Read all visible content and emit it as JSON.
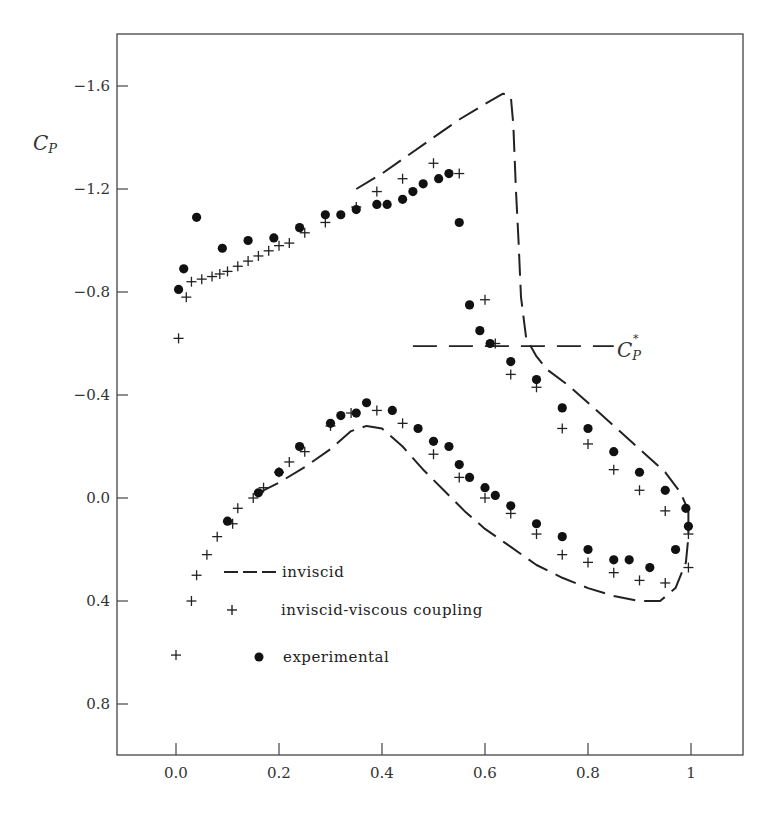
{
  "chart_data": {
    "type": "scatter",
    "title": "",
    "xlabel": "",
    "ylabel": "C_P",
    "xlim": [
      -0.11,
      1.1
    ],
    "ylim": [
      1.0,
      -1.8
    ],
    "y_inverted": true,
    "grid": false,
    "legend_position": "lower-left inside plot",
    "x_ticks": [
      {
        "value": 0.0,
        "label": "0.0"
      },
      {
        "value": 0.2,
        "label": "0.2"
      },
      {
        "value": 0.4,
        "label": "0.4"
      },
      {
        "value": 0.6,
        "label": "0.6"
      },
      {
        "value": 0.8,
        "label": "0.8"
      },
      {
        "value": 1.0,
        "label": "1"
      }
    ],
    "y_ticks": [
      {
        "value": -1.6,
        "label": "−1.6"
      },
      {
        "value": -1.2,
        "label": "−1.2"
      },
      {
        "value": -0.8,
        "label": "−0.8"
      },
      {
        "value": -0.4,
        "label": "−0.4"
      },
      {
        "value": 0.0,
        "label": "0.0"
      },
      {
        "value": 0.4,
        "label": "0.4"
      },
      {
        "value": 0.8,
        "label": "0.8"
      }
    ],
    "annotations": [
      {
        "text": "C_P*",
        "x": 0.86,
        "y": -0.59,
        "note": "critical pressure coefficient, horizontal dashed line from x=0.46 to x=0.86"
      }
    ],
    "critical_cp": {
      "value": -0.59,
      "x_start": 0.46,
      "x_end": 0.85
    },
    "series": [
      {
        "name": "inviscid",
        "style": "dashed-line",
        "upper": [
          [
            0.35,
            -1.2
          ],
          [
            0.4,
            -1.26
          ],
          [
            0.45,
            -1.33
          ],
          [
            0.5,
            -1.4
          ],
          [
            0.55,
            -1.47
          ],
          [
            0.6,
            -1.53
          ],
          [
            0.635,
            -1.57
          ],
          [
            0.65,
            -1.56
          ],
          [
            0.655,
            -1.45
          ],
          [
            0.66,
            -1.2
          ],
          [
            0.665,
            -1.0
          ],
          [
            0.67,
            -0.78
          ],
          [
            0.68,
            -0.62
          ],
          [
            0.7,
            -0.55
          ],
          [
            0.72,
            -0.5
          ],
          [
            0.76,
            -0.44
          ],
          [
            0.8,
            -0.37
          ],
          [
            0.85,
            -0.28
          ],
          [
            0.9,
            -0.19
          ],
          [
            0.95,
            -0.1
          ],
          [
            0.98,
            -0.02
          ],
          [
            0.995,
            0.05
          ]
        ],
        "lower": [
          [
            0.16,
            -0.02
          ],
          [
            0.2,
            -0.06
          ],
          [
            0.25,
            -0.12
          ],
          [
            0.3,
            -0.19
          ],
          [
            0.34,
            -0.26
          ],
          [
            0.37,
            -0.28
          ],
          [
            0.4,
            -0.27
          ],
          [
            0.44,
            -0.2
          ],
          [
            0.48,
            -0.11
          ],
          [
            0.52,
            -0.03
          ],
          [
            0.56,
            0.05
          ],
          [
            0.6,
            0.12
          ],
          [
            0.65,
            0.19
          ],
          [
            0.7,
            0.26
          ],
          [
            0.75,
            0.31
          ],
          [
            0.8,
            0.35
          ],
          [
            0.85,
            0.38
          ],
          [
            0.9,
            0.4
          ],
          [
            0.94,
            0.4
          ],
          [
            0.97,
            0.35
          ],
          [
            0.99,
            0.25
          ],
          [
            0.995,
            0.15
          ],
          [
            0.995,
            0.05
          ]
        ]
      },
      {
        "name": "inviscid-viscous coupling",
        "marker": "+",
        "points": [
          [
            0.005,
            -0.62
          ],
          [
            0.02,
            -0.78
          ],
          [
            0.03,
            -0.84
          ],
          [
            0.05,
            -0.85
          ],
          [
            0.07,
            -0.86
          ],
          [
            0.085,
            -0.87
          ],
          [
            0.1,
            -0.88
          ],
          [
            0.12,
            -0.9
          ],
          [
            0.14,
            -0.92
          ],
          [
            0.16,
            -0.94
          ],
          [
            0.18,
            -0.96
          ],
          [
            0.2,
            -0.98
          ],
          [
            0.22,
            -0.99
          ],
          [
            0.25,
            -1.03
          ],
          [
            0.29,
            -1.07
          ],
          [
            0.35,
            -1.13
          ],
          [
            0.39,
            -1.19
          ],
          [
            0.44,
            -1.24
          ],
          [
            0.5,
            -1.3
          ],
          [
            0.55,
            -1.26
          ],
          [
            0.6,
            -0.77
          ],
          [
            0.62,
            -0.6
          ],
          [
            0.65,
            -0.48
          ],
          [
            0.7,
            -0.43
          ],
          [
            0.75,
            -0.27
          ],
          [
            0.8,
            -0.21
          ],
          [
            0.85,
            -0.11
          ],
          [
            0.9,
            -0.03
          ],
          [
            0.95,
            0.05
          ],
          [
            0.995,
            0.14
          ],
          [
            0.0,
            0.61
          ],
          [
            0.03,
            0.4
          ],
          [
            0.04,
            0.3
          ],
          [
            0.06,
            0.22
          ],
          [
            0.08,
            0.15
          ],
          [
            0.11,
            0.1
          ],
          [
            0.12,
            0.04
          ],
          [
            0.15,
            0.0
          ],
          [
            0.17,
            -0.04
          ],
          [
            0.2,
            -0.1
          ],
          [
            0.22,
            -0.14
          ],
          [
            0.25,
            -0.18
          ],
          [
            0.3,
            -0.28
          ],
          [
            0.34,
            -0.33
          ],
          [
            0.39,
            -0.34
          ],
          [
            0.44,
            -0.29
          ],
          [
            0.5,
            -0.17
          ],
          [
            0.55,
            -0.08
          ],
          [
            0.6,
            -0.0
          ],
          [
            0.65,
            0.06
          ],
          [
            0.7,
            0.14
          ],
          [
            0.75,
            0.22
          ],
          [
            0.8,
            0.25
          ],
          [
            0.85,
            0.29
          ],
          [
            0.9,
            0.32
          ],
          [
            0.95,
            0.33
          ],
          [
            0.995,
            0.27
          ]
        ]
      },
      {
        "name": "experimental",
        "marker": "filled-circle",
        "points": [
          [
            0.005,
            -0.81
          ],
          [
            0.015,
            -0.89
          ],
          [
            0.04,
            -1.09
          ],
          [
            0.09,
            -0.97
          ],
          [
            0.14,
            -1.0
          ],
          [
            0.19,
            -1.01
          ],
          [
            0.24,
            -1.05
          ],
          [
            0.29,
            -1.1
          ],
          [
            0.32,
            -1.1
          ],
          [
            0.35,
            -1.12
          ],
          [
            0.39,
            -1.14
          ],
          [
            0.41,
            -1.14
          ],
          [
            0.44,
            -1.16
          ],
          [
            0.46,
            -1.19
          ],
          [
            0.48,
            -1.22
          ],
          [
            0.51,
            -1.24
          ],
          [
            0.53,
            -1.26
          ],
          [
            0.55,
            -1.07
          ],
          [
            0.57,
            -0.75
          ],
          [
            0.59,
            -0.65
          ],
          [
            0.61,
            -0.6
          ],
          [
            0.65,
            -0.53
          ],
          [
            0.7,
            -0.46
          ],
          [
            0.75,
            -0.35
          ],
          [
            0.8,
            -0.27
          ],
          [
            0.85,
            -0.18
          ],
          [
            0.9,
            -0.1
          ],
          [
            0.95,
            -0.03
          ],
          [
            0.99,
            0.04
          ],
          [
            0.995,
            0.11
          ],
          [
            0.1,
            0.09
          ],
          [
            0.16,
            -0.02
          ],
          [
            0.2,
            -0.1
          ],
          [
            0.24,
            -0.2
          ],
          [
            0.3,
            -0.29
          ],
          [
            0.32,
            -0.32
          ],
          [
            0.35,
            -0.33
          ],
          [
            0.37,
            -0.37
          ],
          [
            0.42,
            -0.34
          ],
          [
            0.47,
            -0.27
          ],
          [
            0.5,
            -0.22
          ],
          [
            0.53,
            -0.2
          ],
          [
            0.55,
            -0.13
          ],
          [
            0.57,
            -0.08
          ],
          [
            0.6,
            -0.04
          ],
          [
            0.62,
            -0.01
          ],
          [
            0.65,
            0.03
          ],
          [
            0.7,
            0.1
          ],
          [
            0.75,
            0.15
          ],
          [
            0.8,
            0.2
          ],
          [
            0.85,
            0.24
          ],
          [
            0.88,
            0.24
          ],
          [
            0.92,
            0.27
          ],
          [
            0.97,
            0.2
          ]
        ]
      }
    ]
  },
  "axis": {
    "y_label_main": "C",
    "y_label_sub": "P",
    "cp_star_main": "C",
    "cp_star_sub": "P",
    "cp_star_sup": "*"
  },
  "legend": {
    "items": [
      {
        "symbol": "dashed-line",
        "label": "inviscid"
      },
      {
        "symbol": "+",
        "label": "inviscid-viscous coupling"
      },
      {
        "symbol": "filled-circle",
        "label": "experimental"
      }
    ]
  }
}
